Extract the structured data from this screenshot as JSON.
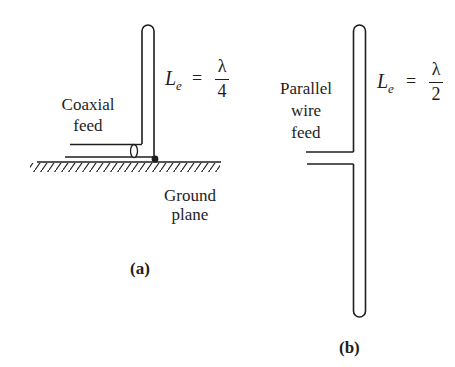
{
  "figure": {
    "panel_a": {
      "caption": "(a)",
      "feed_label": [
        "Coaxial",
        "feed"
      ],
      "ground_label": [
        "Ground",
        "plane"
      ],
      "equation": {
        "lhs": "L",
        "subscript": "e",
        "equals": "=",
        "numerator": "λ",
        "denominator": "4"
      },
      "elements": [
        "monopole-antenna",
        "coaxial-feed",
        "ground-plane"
      ]
    },
    "panel_b": {
      "caption": "(b)",
      "feed_label": [
        "Parallel",
        "wire",
        "feed"
      ],
      "equation": {
        "lhs": "L",
        "subscript": "e",
        "equals": "=",
        "numerator": "λ",
        "denominator": "2"
      },
      "elements": [
        "folded-dipole-antenna",
        "parallel-wire-feed"
      ]
    },
    "colors": {
      "ink": "#1e1e1e",
      "background": "#ffffff"
    }
  }
}
